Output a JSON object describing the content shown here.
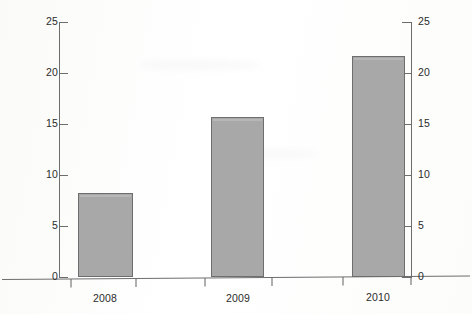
{
  "chart_data": {
    "type": "bar",
    "title": "",
    "subtitle": "",
    "xlabel": "",
    "ylabel": "",
    "categories": [
      "2008",
      "2009",
      "2010"
    ],
    "values": [
      8.2,
      15.7,
      21.7
    ],
    "series": [
      {
        "name": "value",
        "values": [
          8.2,
          15.7,
          21.7
        ]
      }
    ],
    "ylim": [
      0,
      25
    ],
    "yticks": [
      0,
      5,
      10,
      15,
      20,
      25
    ],
    "ytick_labels_left": [
      "0",
      "5",
      "10",
      "15",
      "20",
      "25"
    ],
    "ytick_labels_right": [
      "0",
      "5",
      "10",
      "15",
      "20",
      "25"
    ],
    "right_axis": true,
    "grid": false,
    "legend": null,
    "legend_position": "none",
    "bar_fill_color": "#a8a8a8",
    "bar_border_color": "#6e6e6e",
    "axis_color": "#6d6d6d",
    "background_color": "#ffffff",
    "text_color": "#2b2b2b",
    "annotations": []
  },
  "axes": {
    "left_ticks": [
      {
        "label": "25",
        "value": 25
      },
      {
        "label": "20",
        "value": 20
      },
      {
        "label": "15",
        "value": 15
      },
      {
        "label": "10",
        "value": 10
      },
      {
        "label": "5",
        "value": 5
      },
      {
        "label": "0",
        "value": 0
      }
    ],
    "right_ticks": [
      {
        "label": "25",
        "value": 25
      },
      {
        "label": "20",
        "value": 20
      },
      {
        "label": "15",
        "value": 15
      },
      {
        "label": "10",
        "value": 10
      },
      {
        "label": "5",
        "value": 5
      },
      {
        "label": "0",
        "value": 0
      }
    ],
    "category_labels": [
      {
        "label": "2008"
      },
      {
        "label": "2009"
      },
      {
        "label": "2010"
      }
    ]
  }
}
